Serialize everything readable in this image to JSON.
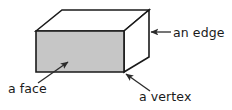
{
  "diagram": {
    "shape_name": "rectangular-prism",
    "colors": {
      "front_face_fill": "#c6c6c6",
      "top_face_fill": "#ffffff",
      "side_face_fill": "#ffffff",
      "outline": "#1a1a1a",
      "annotation_line": "#2b2b2b",
      "text": "#1a1a1a",
      "background": "#ffffff"
    },
    "geometry": {
      "front_top_left": [
        36,
        31
      ],
      "front_top_right": [
        124,
        31
      ],
      "front_bottom_right": [
        124,
        72
      ],
      "front_bottom_left": [
        36,
        72
      ],
      "back_top_left": [
        62,
        10
      ],
      "back_top_right": [
        149,
        10
      ],
      "back_bottom_right": [
        149,
        57
      ]
    },
    "labels": [
      {
        "id": "edge",
        "text": "an edge",
        "text_x": 173,
        "text_y": 37,
        "arrow_from": [
          171,
          32
        ],
        "arrow_to": [
          151,
          32
        ],
        "anchor": "start"
      },
      {
        "id": "face",
        "text": "a face",
        "text_x": 8,
        "text_y": 93,
        "arrow_from": [
          38,
          83
        ],
        "arrow_to": [
          68,
          62
        ],
        "anchor": "start"
      },
      {
        "id": "vertex",
        "text": "a vertex",
        "text_x": 139,
        "text_y": 101,
        "arrow_from": [
          150,
          91
        ],
        "arrow_to": [
          126,
          74
        ],
        "anchor": "start"
      }
    ]
  }
}
